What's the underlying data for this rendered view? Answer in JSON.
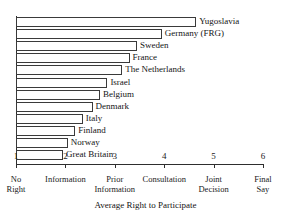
{
  "figure": {
    "top_cut_text": "",
    "axis_title": "Average Right to Participate"
  },
  "chart_data": {
    "type": "bar",
    "orientation": "horizontal",
    "title": "",
    "subtitle": "",
    "xlabel": "Average Right to Participate",
    "ylabel": "",
    "xlim": [
      1,
      6
    ],
    "grid": false,
    "legend": null,
    "categories": [
      "Yugoslavia",
      "Germany (FRG)",
      "Sweden",
      "France",
      "The Netherlands",
      "Israel",
      "Belgium",
      "Denmark",
      "Italy",
      "Finland",
      "Norway",
      "Great Britain"
    ],
    "values": [
      4.65,
      3.95,
      3.45,
      3.3,
      3.15,
      2.85,
      2.7,
      2.55,
      2.35,
      2.2,
      2.05,
      1.95
    ],
    "x_ticks": [
      {
        "value": 1,
        "label": "1",
        "line1": "No",
        "line2": "Right"
      },
      {
        "value": 2,
        "label": "2",
        "line1": "Information",
        "line2": ""
      },
      {
        "value": 3,
        "label": "3",
        "line1": "Prior",
        "line2": "Information"
      },
      {
        "value": 4,
        "label": "4",
        "line1": "Consultation",
        "line2": ""
      },
      {
        "value": 5,
        "label": "5",
        "line1": "Joint",
        "line2": "Decision"
      },
      {
        "value": 6,
        "label": "6",
        "line1": "Final",
        "line2": "Say"
      }
    ],
    "colors": {
      "bar_fill": "#ffffff",
      "bar_stroke": "#3a3a3a",
      "axis": "#2e2e2e",
      "text": "#141414",
      "background": "#ffffff"
    }
  }
}
